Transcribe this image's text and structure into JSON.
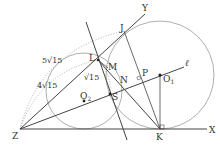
{
  "points": {
    "Z": "Z",
    "X": "X",
    "Y": "Y",
    "K": "K",
    "J": "J",
    "L": "L",
    "M": "M",
    "N": "N",
    "P": "P",
    "S": "S",
    "O1": "O",
    "O1_sub": "1",
    "O2": "O",
    "O2_sub": "2"
  },
  "line_label": "ℓ",
  "measures": {
    "outer_arc": "5√15",
    "inner_arc": "4√15",
    "small_arc": "√15"
  },
  "colors": {
    "line": "#444444",
    "circle": "#888888",
    "dotted": "#aaaaaa"
  }
}
